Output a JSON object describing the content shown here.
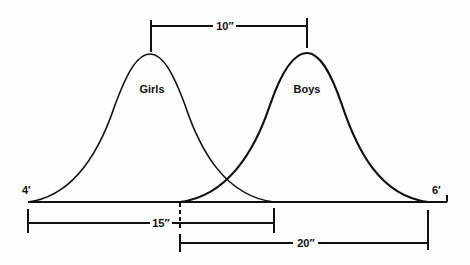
{
  "diagram": {
    "curves": [
      {
        "label": "Girls",
        "start_x": 28,
        "peak_x": 150,
        "end_x": 274
      },
      {
        "label": "Boys",
        "start_x": 180,
        "peak_x": 307,
        "end_x": 428
      }
    ],
    "axis_labels": {
      "left": "4′",
      "right": "6′"
    },
    "dimensions": {
      "peak_difference": "10′′",
      "girls_range": "15′′",
      "boys_range": "20′′"
    },
    "colors": {
      "line": "#111111",
      "background": "#fdfdfd"
    }
  }
}
